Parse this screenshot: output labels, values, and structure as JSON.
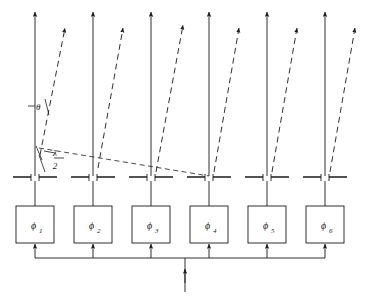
{
  "figure": {
    "type": "phased-array-antenna-diagram",
    "element_count": 6,
    "stroke_color": "#1a1a1a",
    "background": "#ffffff"
  },
  "annotations": {
    "theta_label": "θ",
    "lambda_label": "λ",
    "half_denominator": "2"
  },
  "phase_shifters": [
    {
      "symbol": "ϕ",
      "subscript": "1"
    },
    {
      "symbol": "ϕ",
      "subscript": "2"
    },
    {
      "symbol": "ϕ",
      "subscript": "3"
    },
    {
      "symbol": "ϕ",
      "subscript": "4"
    },
    {
      "symbol": "ϕ",
      "subscript": "5"
    },
    {
      "symbol": "ϕ",
      "subscript": "6"
    }
  ],
  "geometry": {
    "element_x": [
      35,
      93,
      151,
      209,
      267,
      325
    ],
    "dipole_y": 178,
    "box_top": 206,
    "box_bottom": 243,
    "box_width": 38,
    "box_height": 37,
    "bus_y": 258,
    "input_x": 185,
    "input_bottom": 292,
    "boresight_top": 10,
    "beam_tilt_deg": 17,
    "wavefront_from_x": 39,
    "wavefront_from_y": 148,
    "wavefront_to_x": 209,
    "wavefront_to_y": 176
  }
}
